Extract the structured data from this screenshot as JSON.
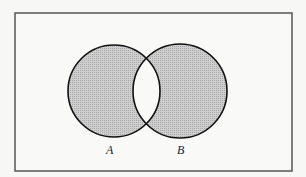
{
  "diagram": {
    "type": "venn",
    "shaded_region": "symmetric difference (A xor B)",
    "sets": [
      {
        "label": "A",
        "cx": 114,
        "cy": 91,
        "r": 46
      },
      {
        "label": "B",
        "cx": 180,
        "cy": 91,
        "r": 47
      }
    ],
    "universe_frame": {
      "x": 15,
      "y": 13,
      "width": 277,
      "height": 158
    },
    "colors": {
      "background": "#f7f7f5",
      "shade": "#c4c4c4",
      "stroke": "#111111",
      "frame": "#555555",
      "intersection": "#f7f7f5"
    }
  }
}
